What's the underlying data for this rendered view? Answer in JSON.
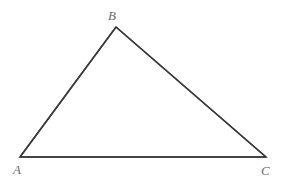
{
  "figure": {
    "name": "triangle-abc",
    "canvas": {
      "width": 282,
      "height": 184,
      "background": "#ffffff"
    },
    "stroke": {
      "color": "#3a3a3a",
      "width": 1.5
    },
    "label_style": {
      "color": "#6b6b6b",
      "font_size": 13,
      "italic": true
    },
    "vertices": [
      {
        "id": "A",
        "label": "A",
        "x": 20,
        "y": 157,
        "label_x": 13,
        "label_y": 163
      },
      {
        "id": "B",
        "label": "B",
        "x": 116,
        "y": 27,
        "label_x": 108,
        "label_y": 9
      },
      {
        "id": "C",
        "label": "C",
        "x": 266,
        "y": 157,
        "label_x": 261,
        "label_y": 164
      }
    ],
    "edges": [
      {
        "id": "AB",
        "from": "A",
        "to": "B"
      },
      {
        "id": "BC",
        "from": "B",
        "to": "C"
      },
      {
        "id": "CA",
        "from": "C",
        "to": "A"
      }
    ],
    "path": "M 20 157 L 116 27 L 266 157 Z"
  }
}
